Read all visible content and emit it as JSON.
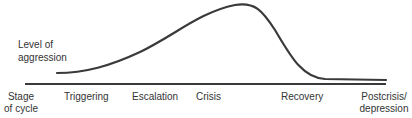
{
  "diagram": {
    "y_label_line1": "Level of",
    "y_label_line2": "aggression",
    "x_axis_label_line1": "Stage",
    "x_axis_label_line2": "of cycle",
    "stages": [
      "Triggering",
      "Escalation",
      "Crisis",
      "Recovery",
      "Postcrisis/",
      "depression"
    ],
    "curve_color": "#3a3a3a",
    "baseline_color": "#3a3a3a"
  }
}
